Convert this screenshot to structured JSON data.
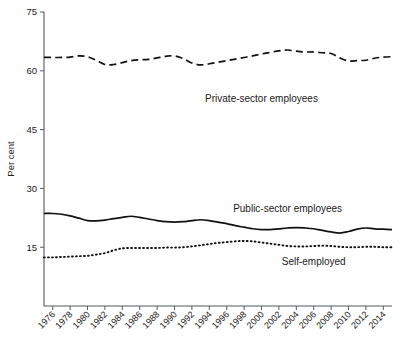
{
  "chart_data": {
    "type": "line",
    "title": "",
    "xlabel": "",
    "ylabel": "Per cent",
    "ylim": [
      0,
      75
    ],
    "xlim": [
      1975,
      2015
    ],
    "yticks": [
      15,
      30,
      45,
      60,
      75
    ],
    "grid": false,
    "legend_position": "inline-annotations",
    "categories": [
      1975,
      1976,
      1977,
      1978,
      1979,
      1980,
      1981,
      1982,
      1983,
      1984,
      1985,
      1986,
      1987,
      1988,
      1989,
      1990,
      1991,
      1992,
      1993,
      1994,
      1995,
      1996,
      1997,
      1998,
      1999,
      2000,
      2001,
      2002,
      2003,
      2004,
      2005,
      2006,
      2007,
      2008,
      2009,
      2010,
      2011,
      2012,
      2013,
      2014,
      2015
    ],
    "xtick_labels": [
      "1976",
      "1978",
      "1980",
      "1982",
      "1984",
      "1986",
      "1988",
      "1990",
      "1992",
      "1994",
      "1996",
      "1998",
      "2000",
      "2002",
      "2004",
      "2006",
      "2008",
      "2010",
      "2012",
      "2014"
    ],
    "xtick_values": [
      1976,
      1978,
      1980,
      1982,
      1984,
      1986,
      1988,
      1990,
      1992,
      1994,
      1996,
      1998,
      2000,
      2002,
      2004,
      2006,
      2008,
      2010,
      2012,
      2014
    ],
    "series": [
      {
        "name": "Private-sector employees",
        "style": "dashed",
        "label_x": 2000,
        "label_y": 52,
        "values": [
          63.4,
          63.4,
          63.4,
          63.5,
          63.8,
          63.6,
          62.7,
          61.6,
          61.6,
          62.1,
          62.6,
          62.8,
          62.9,
          63.3,
          63.7,
          63.8,
          63.1,
          62.0,
          61.5,
          61.8,
          62.2,
          62.6,
          63.0,
          63.4,
          63.8,
          64.3,
          64.7,
          65.1,
          65.3,
          65.0,
          64.8,
          64.8,
          64.6,
          64.4,
          63.3,
          62.5,
          62.6,
          62.7,
          63.2,
          63.5,
          63.6
        ]
      },
      {
        "name": "Public-sector employees",
        "style": "solid",
        "label_x": 2003,
        "label_y": 24,
        "values": [
          23.6,
          23.6,
          23.4,
          23.0,
          22.4,
          21.8,
          21.7,
          21.9,
          22.3,
          22.6,
          22.9,
          22.6,
          22.2,
          21.8,
          21.5,
          21.4,
          21.5,
          21.8,
          22.0,
          21.8,
          21.4,
          21.0,
          20.5,
          20.1,
          19.7,
          19.5,
          19.5,
          19.7,
          19.9,
          20.0,
          19.9,
          19.7,
          19.3,
          18.9,
          18.6,
          19.0,
          19.6,
          19.9,
          19.7,
          19.6,
          19.5
        ]
      },
      {
        "name": "Self-employed",
        "style": "dotted",
        "label_x": 2006,
        "label_y": 10.5,
        "values": [
          12.4,
          12.4,
          12.5,
          12.6,
          12.7,
          12.8,
          13.1,
          13.5,
          14.2,
          14.7,
          14.8,
          14.8,
          14.8,
          14.8,
          14.9,
          14.9,
          15.0,
          15.2,
          15.5,
          15.8,
          16.1,
          16.3,
          16.5,
          16.6,
          16.5,
          16.2,
          15.9,
          15.6,
          15.3,
          15.2,
          15.2,
          15.3,
          15.4,
          15.3,
          15.1,
          15.0,
          15.0,
          15.1,
          15.1,
          15.0,
          15.0
        ]
      }
    ]
  },
  "figure": {
    "y_axis_title": "Per cent"
  }
}
